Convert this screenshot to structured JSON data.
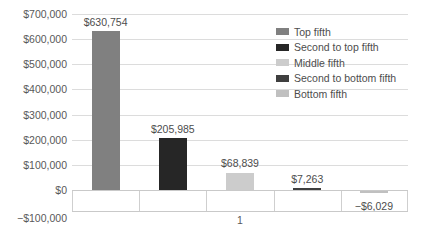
{
  "chart_data": {
    "type": "bar",
    "title": "",
    "subtitle": "",
    "xlabel": "",
    "ylabel": "",
    "grid": true,
    "legend_position": "top-right",
    "ylim": [
      -100000,
      700000
    ],
    "ytick_step": 100000,
    "y_ticks": [
      {
        "value": 700000,
        "label": "$700,000"
      },
      {
        "value": 600000,
        "label": "$600,000"
      },
      {
        "value": 500000,
        "label": "$500,000"
      },
      {
        "value": 400000,
        "label": "$400,000"
      },
      {
        "value": 300000,
        "label": "$300,000"
      },
      {
        "value": 200000,
        "label": "$200,000"
      },
      {
        "value": 100000,
        "label": "$100,000"
      },
      {
        "value": 0,
        "label": "$0"
      },
      {
        "value": -100000,
        "label": "−$100,000"
      }
    ],
    "categories": [
      "Top fifth",
      "Second to top fifth",
      "Middle fifth",
      "Second to bottom fifth",
      "Bottom fifth"
    ],
    "values": [
      630754,
      205985,
      68839,
      7263,
      -6029
    ],
    "data_labels": [
      "$630,754",
      "$205,985",
      "$68,839",
      "$7,263",
      "−$6,029"
    ],
    "bar_colors": [
      "#808080",
      "#262626",
      "#cccccc",
      "#3f3f3f",
      "#c0c0c0"
    ],
    "x_category_axis_label": "1",
    "x_category_axis_label_slot": 3
  },
  "legend": {
    "items": [
      {
        "label": "Top fifth",
        "color": "#808080"
      },
      {
        "label": "Second to top fifth",
        "color": "#262626"
      },
      {
        "label": "Middle fifth",
        "color": "#cccccc"
      },
      {
        "label": "Second to bottom fifth",
        "color": "#3f3f3f"
      },
      {
        "label": "Bottom fifth",
        "color": "#c0c0c0"
      }
    ]
  },
  "axes": {
    "gridline_color": "#dcdcdc",
    "axis_line_color": "#c9c9c9",
    "tick_label_color": "#595959"
  }
}
